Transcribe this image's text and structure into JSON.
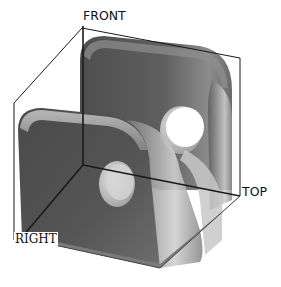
{
  "viewport": {
    "title": "3D model view",
    "planes": {
      "front": "FRONT",
      "top": "TOP",
      "right": "RIGHT"
    }
  },
  "model": {
    "description": "L-shaped bracket with two through holes and rounded corners",
    "holes": 2,
    "colors": {
      "background": "#ffffff",
      "body_dark": "#555555",
      "body_mid": "#7a7a7a",
      "body_light": "#bdbdbd",
      "hole_fill": "#ffffff",
      "plane_line": "#222222"
    }
  }
}
